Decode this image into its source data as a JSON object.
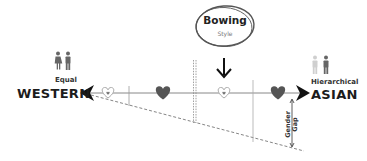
{
  "diagram": {
    "left_pole": {
      "qualifier": "Equal",
      "label": "WESTERN",
      "icon": "man-woman-icon"
    },
    "right_pole": {
      "qualifier": "Hierarchical",
      "label": "ASIAN",
      "icon": "man-woman-icon"
    },
    "callout": {
      "title": "Bowing",
      "subtitle": "Style"
    },
    "gap_label": {
      "line1": "Gender",
      "line2": "Gap"
    },
    "markers": [
      {
        "type": "heart-outline",
        "x": 108
      },
      {
        "type": "heart-filled",
        "x": 163
      },
      {
        "type": "heart-outline",
        "x": 224
      },
      {
        "type": "heart-filled",
        "x": 278
      }
    ],
    "colors": {
      "line": "#888888",
      "arrow": "#111111",
      "heart_filled": "#555555",
      "heart_outline": "#999999",
      "callout_ring": "#555555",
      "icon_dark": "#666666",
      "icon_light": "#cccccc"
    }
  }
}
